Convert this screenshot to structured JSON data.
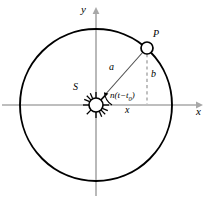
{
  "figure": {
    "type": "orbit-diagram",
    "labels": {
      "y_axis": "y",
      "x_axis": "x",
      "point_p": "P",
      "point_s": "S",
      "radius": "a",
      "ordinate": "b",
      "abscissa": "x",
      "angle_prefix": "n(t−t",
      "angle_subscript": "0",
      "angle_suffix": ")",
      "angle_full": "n(t−t0)"
    },
    "geometry": {
      "center": [
        96,
        105
      ],
      "radius": 76,
      "point_p": [
        147,
        48
      ],
      "marker_radius_p": 6,
      "marker_radius_s": 7,
      "sun_ray_count": 12,
      "angle_arc_degrees": 45
    },
    "colors": {
      "orbit_stroke": "#000000",
      "axis_stroke": "#a8a8a8",
      "dashed_stroke": "#8c8c8c",
      "radius_stroke": "#555555",
      "background": "#ffffff",
      "text": "#000000"
    }
  }
}
